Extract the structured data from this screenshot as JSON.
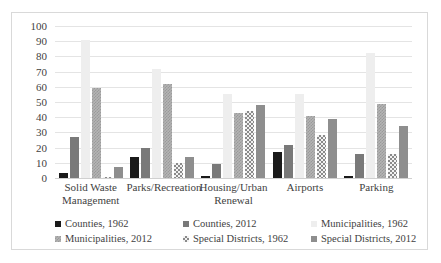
{
  "chart_data": {
    "type": "bar",
    "title": "",
    "xlabel": "",
    "ylabel": "",
    "ylim": [
      0,
      100
    ],
    "ytick_step": 10,
    "yticks": [
      "100",
      "90",
      "80",
      "70",
      "60",
      "50",
      "40",
      "30",
      "20",
      "10",
      "0"
    ],
    "grid": true,
    "legend_position": "bottom",
    "categories": [
      "Solid Waste Management",
      "Parks/Recreation",
      "Housing/Urban Renewal",
      "Airports",
      "Parking"
    ],
    "category_lines": [
      [
        "Solid Waste",
        "Management"
      ],
      [
        "Parks/Recreation"
      ],
      [
        "Housing/Urban",
        "Renewal"
      ],
      [
        "Airports"
      ],
      [
        "Parking"
      ]
    ],
    "series": [
      {
        "name": "Counties, 1962",
        "color": "#1a1a1a",
        "pattern": "solid",
        "values": [
          3,
          14,
          1.5,
          17,
          1.5
        ]
      },
      {
        "name": "Counties, 2012",
        "color": "#797979",
        "pattern": "solid",
        "values": [
          27,
          20,
          9.5,
          22,
          15.5
        ]
      },
      {
        "name": "Municipalities, 1962",
        "color": "#eeeeee",
        "pattern": "solid",
        "values": [
          91,
          72,
          55,
          55,
          82
        ]
      },
      {
        "name": "Municipalities, 2012",
        "color": "#a8a8a8",
        "pattern": "hatch",
        "values": [
          59,
          62,
          43,
          40.5,
          48.5
        ]
      },
      {
        "name": "Special Districts, 1962",
        "color": "#8a8a8a",
        "pattern": "checker",
        "values": [
          0.5,
          10,
          44,
          28,
          15.5
        ]
      },
      {
        "name": "Special Districts, 2012",
        "color": "#8e8e8e",
        "pattern": "solid",
        "values": [
          7,
          14,
          48,
          38.5,
          34.5
        ]
      }
    ]
  },
  "legend": {
    "items": [
      {
        "label": "Counties, 1962"
      },
      {
        "label": "Counties, 2012"
      },
      {
        "label": "Municipalities, 1962"
      },
      {
        "label": "Municipalities, 2012"
      },
      {
        "label": "Special Districts, 1962"
      },
      {
        "label": "Special Districts, 2012"
      }
    ]
  }
}
